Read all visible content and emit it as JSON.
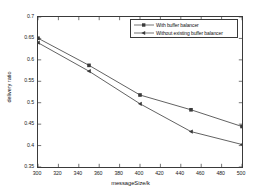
{
  "chart_data": {
    "type": "line",
    "title": "",
    "xlabel": "messageSize/k",
    "ylabel": "delivery ratio",
    "x": [
      300,
      350,
      400,
      450,
      500
    ],
    "xlim": [
      300,
      500
    ],
    "ylim": [
      0.35,
      0.7
    ],
    "xticks": [
      "300",
      "320",
      "340",
      "360",
      "380",
      "400",
      "420",
      "440",
      "460",
      "480",
      "500"
    ],
    "xtick_values": [
      300,
      320,
      340,
      360,
      380,
      400,
      420,
      440,
      460,
      480,
      500
    ],
    "yticks": [
      "0.35",
      "0.4",
      "0.45",
      "0.5",
      "0.55",
      "0.6",
      "0.65",
      "0.7"
    ],
    "ytick_values": [
      0.35,
      0.4,
      0.45,
      0.5,
      0.55,
      0.6,
      0.65,
      0.7
    ],
    "grid": false,
    "legend_position": "top-right",
    "series": [
      {
        "name": "With buffer balancer",
        "marker": "square",
        "color": "#3a3a3a",
        "values": [
          0.6505,
          0.5872,
          0.518,
          0.4835,
          0.4445
        ]
      },
      {
        "name": "Without existing buffer balancer",
        "marker": "left-triangle",
        "color": "#3a3a3a",
        "values": [
          0.64,
          0.5735,
          0.4975,
          0.4326,
          0.4025
        ]
      }
    ]
  },
  "legend": {
    "entries": [
      {
        "label": "With buffer balancer"
      },
      {
        "label": "Without existing buffer balancer"
      }
    ]
  },
  "axes": {
    "x_label": "messageSize/k",
    "y_label": "delivery ratio"
  }
}
